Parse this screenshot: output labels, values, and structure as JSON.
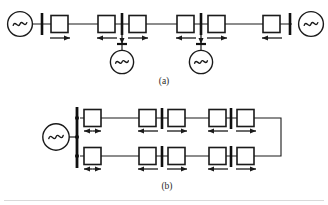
{
  "figure": {
    "background_color": "#ffffff",
    "line_color": "#1a1a1a",
    "bus_color": "#101010",
    "rule_color": "#d9d9d9",
    "captions": [
      {
        "id": "caption-a",
        "text": "(a)"
      },
      {
        "id": "caption-b",
        "text": "(b)"
      }
    ],
    "panels": [
      {
        "id": "panel-a",
        "label": "(a)",
        "description": "Radial / multi-terminal chain topology",
        "generators": [
          {
            "id": "gen-a-left",
            "symbol": "ac-source",
            "position": "left-end"
          },
          {
            "id": "gen-a-mid1",
            "symbol": "ac-source",
            "position": "bus-2-drop"
          },
          {
            "id": "gen-a-mid2",
            "symbol": "ac-source",
            "position": "bus-3-drop"
          },
          {
            "id": "gen-a-right",
            "symbol": "ac-source",
            "position": "right-end"
          }
        ],
        "buses": [
          {
            "id": "bus-a-1",
            "orientation": "vertical"
          },
          {
            "id": "bus-a-2",
            "orientation": "vertical"
          },
          {
            "id": "bus-a-3",
            "orientation": "vertical"
          },
          {
            "id": "bus-a-4",
            "orientation": "vertical"
          }
        ],
        "converters": [
          {
            "id": "conv-a-1",
            "flow": "right"
          },
          {
            "id": "conv-a-2",
            "flow": "left"
          },
          {
            "id": "conv-a-3",
            "flow": "right"
          },
          {
            "id": "conv-a-4",
            "flow": "left"
          },
          {
            "id": "conv-a-5",
            "flow": "right"
          },
          {
            "id": "conv-a-6",
            "flow": "left"
          }
        ]
      },
      {
        "id": "panel-b",
        "label": "(b)",
        "description": "Ring / loop topology fed from a single source bus",
        "generators": [
          {
            "id": "gen-b-left",
            "symbol": "ac-source",
            "position": "left-source"
          }
        ],
        "buses": [
          {
            "id": "bus-b-main",
            "orientation": "vertical"
          },
          {
            "id": "bus-b-top-1",
            "orientation": "vertical"
          },
          {
            "id": "bus-b-top-2",
            "orientation": "vertical"
          },
          {
            "id": "bus-b-bot-1",
            "orientation": "vertical"
          },
          {
            "id": "bus-b-bot-2",
            "orientation": "vertical"
          }
        ],
        "converters": [
          {
            "id": "conv-b-t1",
            "flow": "bidirectional"
          },
          {
            "id": "conv-b-t2",
            "flow": "left"
          },
          {
            "id": "conv-b-t3",
            "flow": "right"
          },
          {
            "id": "conv-b-t4",
            "flow": "left"
          },
          {
            "id": "conv-b-t5",
            "flow": "right"
          },
          {
            "id": "conv-b-b1",
            "flow": "bidirectional"
          },
          {
            "id": "conv-b-b2",
            "flow": "left"
          },
          {
            "id": "conv-b-b3",
            "flow": "right"
          },
          {
            "id": "conv-b-b4",
            "flow": "left"
          },
          {
            "id": "conv-b-b5",
            "flow": "right"
          }
        ]
      }
    ]
  }
}
